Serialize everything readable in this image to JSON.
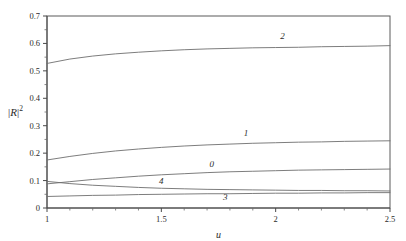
{
  "chart_data": {
    "type": "line",
    "title": "",
    "subtitle": "",
    "xlabel": "u",
    "ylabel": "|R|^2",
    "ylabel_base": "R",
    "ylabel_exponent": "2",
    "xlim": [
      1,
      2.5
    ],
    "ylim": [
      0,
      0.7
    ],
    "grid": false,
    "legend_position": "inline-curve-labels",
    "xticks": [
      1,
      1.5,
      2,
      2.5
    ],
    "xticklabels": [
      "1",
      "1.5",
      "2",
      "2.5"
    ],
    "yticks": [
      0,
      0.1,
      0.2,
      0.3,
      0.4,
      0.5,
      0.6,
      0.7
    ],
    "yticklabels": [
      "0",
      "0.1",
      "0.2",
      "0.3",
      "0.4",
      "0.5",
      "0.6",
      "0.7"
    ],
    "x": [
      1.0,
      1.1,
      1.2,
      1.3,
      1.4,
      1.5,
      1.6,
      1.7,
      1.8,
      1.9,
      2.0,
      2.1,
      2.2,
      2.3,
      2.4,
      2.5
    ],
    "series": [
      {
        "name": "2",
        "label": "2",
        "label_x": 2.03,
        "label_y": 0.617,
        "color": "#6e6e6e",
        "values": [
          0.527,
          0.543,
          0.554,
          0.562,
          0.568,
          0.573,
          0.577,
          0.58,
          0.582,
          0.584,
          0.585,
          0.586,
          0.588,
          0.589,
          0.59,
          0.592
        ]
      },
      {
        "name": "1",
        "label": "1",
        "label_x": 1.87,
        "label_y": 0.262,
        "color": "#6e6e6e",
        "values": [
          0.175,
          0.188,
          0.199,
          0.208,
          0.215,
          0.221,
          0.226,
          0.23,
          0.233,
          0.236,
          0.238,
          0.24,
          0.241,
          0.243,
          0.244,
          0.245
        ]
      },
      {
        "name": "0",
        "label": "0",
        "label_x": 1.72,
        "label_y": 0.148,
        "color": "#6e6e6e",
        "values": [
          0.088,
          0.096,
          0.104,
          0.11,
          0.116,
          0.121,
          0.125,
          0.129,
          0.132,
          0.134,
          0.136,
          0.138,
          0.139,
          0.14,
          0.141,
          0.142
        ]
      },
      {
        "name": "4",
        "label": "4",
        "label_x": 1.5,
        "label_y": 0.087,
        "color": "#6e6e6e",
        "values": [
          0.097,
          0.089,
          0.083,
          0.079,
          0.075,
          0.072,
          0.07,
          0.068,
          0.067,
          0.066,
          0.065,
          0.064,
          0.064,
          0.063,
          0.063,
          0.062
        ]
      },
      {
        "name": "3",
        "label": "3",
        "label_x": 1.78,
        "label_y": 0.028,
        "color": "#6e6e6e",
        "values": [
          0.042,
          0.044,
          0.046,
          0.047,
          0.049,
          0.05,
          0.051,
          0.052,
          0.052,
          0.053,
          0.054,
          0.054,
          0.055,
          0.055,
          0.056,
          0.056
        ]
      }
    ]
  }
}
